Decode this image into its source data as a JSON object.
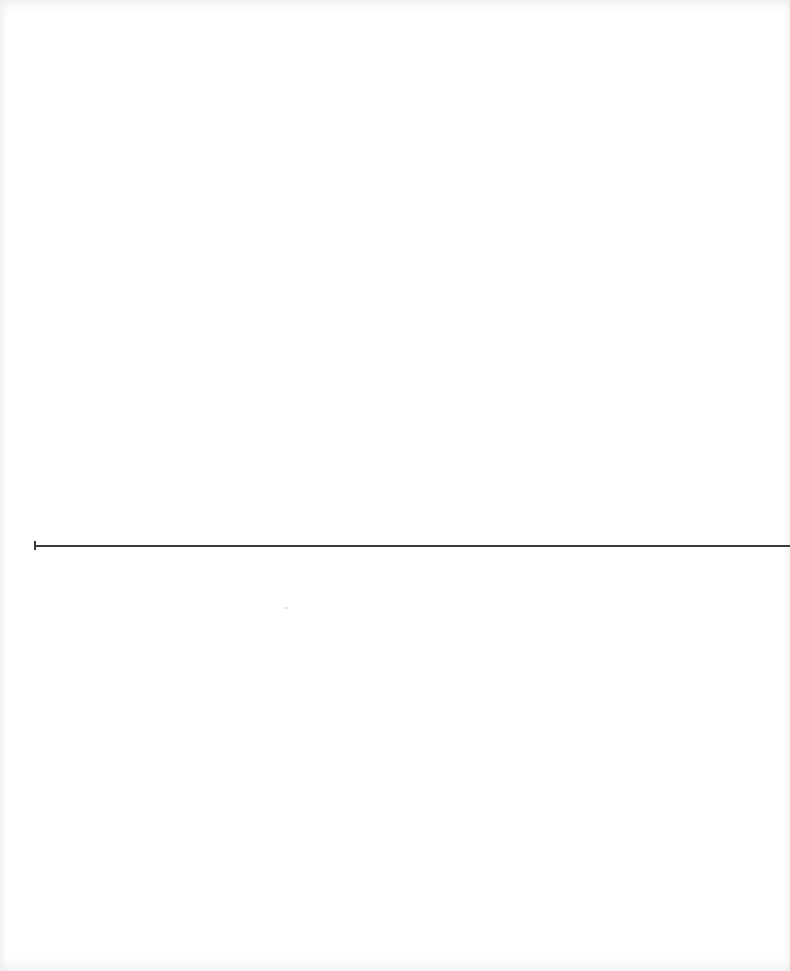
{
  "document": {
    "type": "scanned-blank-page",
    "text": "",
    "rule": {
      "color": "#3a3a3a",
      "y": 545
    }
  }
}
